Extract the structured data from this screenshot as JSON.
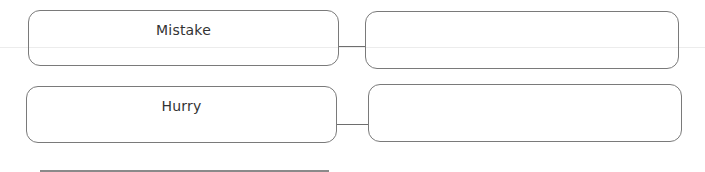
{
  "worksheet": {
    "rows": [
      {
        "word": "Mistake",
        "answer": ""
      },
      {
        "word": "Hurry",
        "answer": ""
      }
    ]
  }
}
